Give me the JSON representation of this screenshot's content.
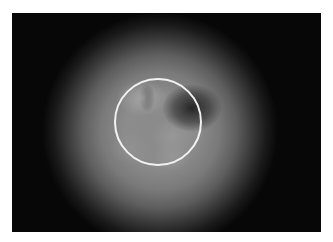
{
  "image": {
    "description": "Grayscale endoscopic view with circular highlight overlay",
    "overlay": {
      "shape": "circle",
      "color": "#f2f2f2",
      "center": [
        159,
        124
      ],
      "radius": 44
    },
    "frame": {
      "background": "#050505"
    }
  }
}
